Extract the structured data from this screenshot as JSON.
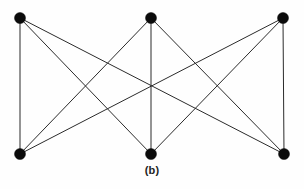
{
  "figure": {
    "caption": "(b)",
    "background_color": "#fefefe",
    "edge_color": "#2b2b2b",
    "vertex_color": "#0b0b0b",
    "vertex_radius": 5.5,
    "edge_width": 1
  },
  "chart_data": {
    "type": "diagram",
    "graph_type": "complete-bipartite",
    "graph_name": "K3,3",
    "title": "(b)",
    "xlabel": "",
    "ylabel": "",
    "node_count": 6,
    "edge_count": 9,
    "nodes": [
      {
        "id": "u1",
        "label": "",
        "set": "top",
        "x": 20,
        "y": 18
      },
      {
        "id": "u2",
        "label": "",
        "set": "top",
        "x": 151,
        "y": 18
      },
      {
        "id": "u3",
        "label": "",
        "set": "top",
        "x": 283,
        "y": 18
      },
      {
        "id": "v1",
        "label": "",
        "set": "bottom",
        "x": 20,
        "y": 154
      },
      {
        "id": "v2",
        "label": "",
        "set": "bottom",
        "x": 151,
        "y": 154
      },
      {
        "id": "v3",
        "label": "",
        "set": "bottom",
        "x": 284,
        "y": 154
      }
    ],
    "edges": [
      {
        "from": "u1",
        "to": "v1"
      },
      {
        "from": "u1",
        "to": "v2"
      },
      {
        "from": "u1",
        "to": "v3"
      },
      {
        "from": "u2",
        "to": "v1"
      },
      {
        "from": "u2",
        "to": "v2"
      },
      {
        "from": "u2",
        "to": "v3"
      },
      {
        "from": "u3",
        "to": "v1"
      },
      {
        "from": "u3",
        "to": "v2"
      },
      {
        "from": "u3",
        "to": "v3"
      }
    ]
  }
}
